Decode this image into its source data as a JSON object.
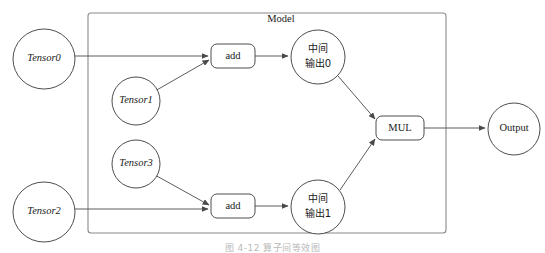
{
  "figure": {
    "title": "Model",
    "caption": "图 4-12  算子间等效图",
    "background_color": "#ffffff",
    "stroke_color": "#3a3a3a",
    "group_stroke_color": "#8a8a8a"
  },
  "group": {
    "label": "Model",
    "x": 88,
    "y": 13,
    "width": 358,
    "height": 220
  },
  "nodes": {
    "tensor0": {
      "label": "Tensor0",
      "shape": "ellipse",
      "cx": 44,
      "cy": 59,
      "rx": 31,
      "ry": 30,
      "style": "italic"
    },
    "tensor1": {
      "label": "Tensor1",
      "shape": "ellipse",
      "cx": 136,
      "cy": 101,
      "rx": 24,
      "ry": 24,
      "style": "italic"
    },
    "tensor2": {
      "label": "Tensor2",
      "shape": "ellipse",
      "cx": 44,
      "cy": 212,
      "rx": 31,
      "ry": 30,
      "style": "italic"
    },
    "tensor3": {
      "label": "Tensor3",
      "shape": "ellipse",
      "cx": 136,
      "cy": 164,
      "rx": 24,
      "ry": 24,
      "style": "italic"
    },
    "add0": {
      "label": "add",
      "shape": "roundrect",
      "x": 211,
      "y": 44,
      "width": 44,
      "height": 24,
      "style": "plain"
    },
    "add1": {
      "label": "add",
      "shape": "roundrect",
      "x": 211,
      "y": 194,
      "width": 44,
      "height": 24,
      "style": "plain"
    },
    "mid0": {
      "label_line1": "中间",
      "label_line2": "输出0",
      "shape": "ellipse",
      "cx": 318,
      "cy": 57,
      "rx": 27,
      "ry": 27,
      "style": "cjk"
    },
    "mid1": {
      "label_line1": "中间",
      "label_line2": "输出1",
      "shape": "ellipse",
      "cx": 318,
      "cy": 207,
      "rx": 27,
      "ry": 27,
      "style": "cjk"
    },
    "mul": {
      "label": "MUL",
      "shape": "roundrect",
      "x": 376,
      "y": 116,
      "width": 48,
      "height": 24,
      "style": "plain"
    },
    "output": {
      "label": "Output",
      "shape": "ellipse",
      "cx": 514,
      "cy": 129,
      "rx": 26,
      "ry": 26,
      "style": "plain"
    }
  },
  "edges": [
    {
      "name": "tensor0-to-add0",
      "from": "tensor0",
      "to": "add0"
    },
    {
      "name": "tensor1-to-add0",
      "from": "tensor1",
      "to": "add0"
    },
    {
      "name": "add0-to-mid0",
      "from": "add0",
      "to": "mid0"
    },
    {
      "name": "mid0-to-mul",
      "from": "mid0",
      "to": "mul"
    },
    {
      "name": "tensor2-to-add1",
      "from": "tensor2",
      "to": "add1"
    },
    {
      "name": "tensor3-to-add1",
      "from": "tensor3",
      "to": "add1"
    },
    {
      "name": "add1-to-mid1",
      "from": "add1",
      "to": "mid1"
    },
    {
      "name": "mid1-to-mul",
      "from": "mid1",
      "to": "mul"
    },
    {
      "name": "mul-to-output",
      "from": "mul",
      "to": "output"
    }
  ]
}
